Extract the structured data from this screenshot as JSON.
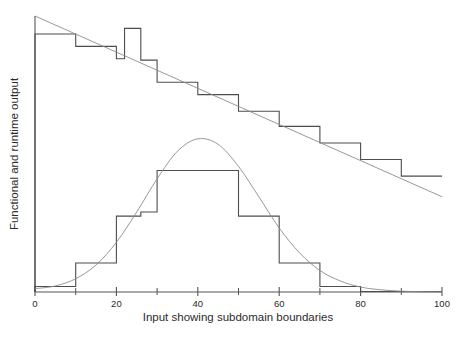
{
  "chart_data": {
    "type": "line",
    "title": "",
    "subtitle": "",
    "xlabel": "Input showing subdomain boundaries",
    "ylabel": "Functional and runtime output",
    "xlim": [
      0,
      100
    ],
    "ylim": [
      0,
      1.0
    ],
    "grid": false,
    "legend": false,
    "legend_position": "none",
    "x_major_ticks": [
      0,
      20,
      40,
      60,
      80,
      100
    ],
    "x_major_tick_labels": [
      "0",
      "20",
      "40",
      "60",
      "80",
      "100"
    ],
    "x_minor_ticks": [
      10,
      30,
      50,
      70,
      90
    ],
    "y_ticks": [],
    "y_tick_labels": [],
    "subdomain_boundaries": [
      0,
      10,
      20,
      30,
      40,
      50,
      60,
      70,
      80,
      90,
      100
    ],
    "series": [
      {
        "name": "functional-output-step",
        "style": "step",
        "color": "#4d4d4d",
        "description": "Descending staircase of measured functional output per subdomain, with an anomalous spike near input 22-26",
        "steps": [
          {
            "x0": 0,
            "x1": 10,
            "value": 0.935
          },
          {
            "x0": 10,
            "x1": 20,
            "value": 0.89
          },
          {
            "x0": 20,
            "x1": 22,
            "value": 0.845
          },
          {
            "x0": 22,
            "x1": 26,
            "value": 0.955
          },
          {
            "x0": 26,
            "x1": 30,
            "value": 0.84
          },
          {
            "x0": 30,
            "x1": 40,
            "value": 0.76
          },
          {
            "x0": 40,
            "x1": 50,
            "value": 0.715
          },
          {
            "x0": 50,
            "x1": 60,
            "value": 0.655
          },
          {
            "x0": 60,
            "x1": 70,
            "value": 0.6
          },
          {
            "x0": 70,
            "x1": 80,
            "value": 0.54
          },
          {
            "x0": 80,
            "x1": 90,
            "value": 0.48
          },
          {
            "x0": 90,
            "x1": 100,
            "value": 0.42
          }
        ]
      },
      {
        "name": "runtime-output-step",
        "style": "step",
        "color": "#4d4d4d",
        "description": "Bell-shaped staircase of measured runtime output per subdomain, with a fine sub-step near input 26-30",
        "steps": [
          {
            "x0": 0,
            "x1": 10,
            "value": 0.02
          },
          {
            "x0": 10,
            "x1": 20,
            "value": 0.105
          },
          {
            "x0": 20,
            "x1": 26,
            "value": 0.275
          },
          {
            "x0": 26,
            "x1": 30,
            "value": 0.29
          },
          {
            "x0": 30,
            "x1": 50,
            "value": 0.44
          },
          {
            "x0": 50,
            "x1": 60,
            "value": 0.275
          },
          {
            "x0": 60,
            "x1": 70,
            "value": 0.105
          },
          {
            "x0": 70,
            "x1": 80,
            "value": 0.02
          },
          {
            "x0": 80,
            "x1": 100,
            "value": 0.002
          }
        ]
      },
      {
        "name": "functional-output-trend",
        "style": "line",
        "color": "#8c8c8c",
        "description": "Smooth linear trend of ideal functional output",
        "points": [
          {
            "x": 0,
            "y": 1.0
          },
          {
            "x": 100,
            "y": 0.345
          }
        ]
      },
      {
        "name": "runtime-output-trend",
        "style": "curve",
        "color": "#8c8c8c",
        "description": "Smooth Gaussian trend of ideal runtime output, peak near input 40",
        "points": [
          {
            "x": 0,
            "y": 0.012
          },
          {
            "x": 5,
            "y": 0.022
          },
          {
            "x": 10,
            "y": 0.048
          },
          {
            "x": 15,
            "y": 0.098
          },
          {
            "x": 20,
            "y": 0.18
          },
          {
            "x": 25,
            "y": 0.29
          },
          {
            "x": 30,
            "y": 0.41
          },
          {
            "x": 35,
            "y": 0.51
          },
          {
            "x": 40,
            "y": 0.555
          },
          {
            "x": 45,
            "y": 0.535
          },
          {
            "x": 50,
            "y": 0.455
          },
          {
            "x": 55,
            "y": 0.345
          },
          {
            "x": 60,
            "y": 0.232
          },
          {
            "x": 65,
            "y": 0.142
          },
          {
            "x": 70,
            "y": 0.078
          },
          {
            "x": 75,
            "y": 0.04
          },
          {
            "x": 80,
            "y": 0.018
          },
          {
            "x": 85,
            "y": 0.008
          },
          {
            "x": 90,
            "y": 0.003
          },
          {
            "x": 95,
            "y": 0.001
          },
          {
            "x": 100,
            "y": 0.0
          }
        ]
      }
    ]
  },
  "axes": {
    "x_label": "Input showing subdomain boundaries",
    "y_label": "Functional and runtime output",
    "tick_labels": [
      "0",
      "20",
      "40",
      "60",
      "80",
      "100"
    ]
  },
  "colors": {
    "background": "#ffffff",
    "axis": "#555555",
    "step_line": "#4d4d4d",
    "trend_line": "#8c8c8c",
    "text": "#2b2b2b"
  }
}
